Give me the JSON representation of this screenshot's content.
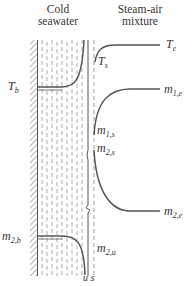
{
  "headers": {
    "left_line1": "Cold",
    "left_line2": "seawater",
    "right_line1": "Steam-air",
    "right_line2": "mixture"
  },
  "labels": {
    "Te": {
      "base": "T",
      "sub": "e"
    },
    "Ts": {
      "base": "T",
      "sub": "s"
    },
    "Tb": {
      "base": "T",
      "sub": "b"
    },
    "m1e": {
      "base": "m",
      "sub": "1,e"
    },
    "m1s": {
      "base": "m",
      "sub": "1,s"
    },
    "m2s": {
      "base": "m",
      "sub": "2,s"
    },
    "m2e": {
      "base": "m",
      "sub": "2,e"
    },
    "m2b": {
      "base": "m",
      "sub": "2,b"
    },
    "m2u": {
      "base": "m",
      "sub": "2,u"
    },
    "us": "u s"
  },
  "colors": {
    "line": "#555555",
    "hatch": "#777777",
    "dash": "#888888",
    "text": "#333333"
  }
}
